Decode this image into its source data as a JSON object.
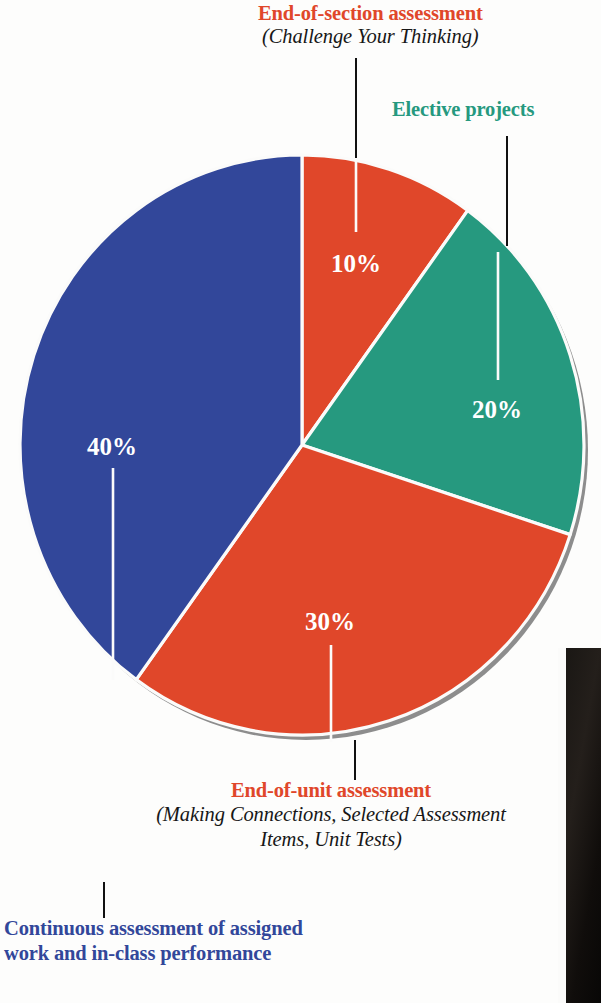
{
  "chart_data": {
    "type": "pie",
    "categories": [
      "End-of-section assessment",
      "Elective projects",
      "End-of-unit assessment",
      "Continuous assessment of assigned work and in-class performance"
    ],
    "values": [
      10,
      20,
      30,
      40
    ],
    "value_labels": [
      "10%",
      "20%",
      "30%",
      "40%"
    ],
    "colors": [
      "#e0472a",
      "#26997f",
      "#e0472a",
      "#32479a"
    ],
    "start_angle_deg": 0,
    "direction": "clockwise",
    "legend": "callout labels with leader lines",
    "grid": false
  },
  "pie": {
    "center_x": 302,
    "center_y": 445,
    "radius_x": 282,
    "radius_y": 290,
    "shadow_color": "#8d8d8d",
    "separator_color": "#fbfbfa",
    "slices": [
      {
        "name": "end-of-section",
        "label": "10%",
        "value": 10,
        "color": "#e0472a",
        "start_deg": 0,
        "end_deg": 36,
        "label_x": 356,
        "label_y": 272
      },
      {
        "name": "elective-projects",
        "label": "20%",
        "value": 20,
        "color": "#26997f",
        "start_deg": 36,
        "end_deg": 108,
        "label_x": 497,
        "label_y": 418
      },
      {
        "name": "end-of-unit",
        "label": "30%",
        "value": 30,
        "color": "#e0472a",
        "start_deg": 108,
        "end_deg": 216,
        "label_x": 330,
        "label_y": 630
      },
      {
        "name": "continuous-assessment",
        "label": "40%",
        "value": 40,
        "color": "#32479a",
        "start_deg": 216,
        "end_deg": 360,
        "label_x": 112,
        "label_y": 455
      }
    ]
  },
  "callouts": {
    "section": {
      "heading": "End-of-section assessment",
      "subtitle": "(Challenge Your Thinking)",
      "color": "#e0472a"
    },
    "elective": {
      "heading": "Elective projects",
      "subtitle": "",
      "color": "#26997f"
    },
    "unit": {
      "heading": "End-of-unit assessment",
      "subtitle": "(Making Connections, Selected Assessment Items, Unit Tests)",
      "color": "#e0472a"
    },
    "continuous": {
      "heading": "Continuous assessment of assigned work and in-class performance",
      "subtitle": "",
      "color": "#32479a"
    }
  }
}
